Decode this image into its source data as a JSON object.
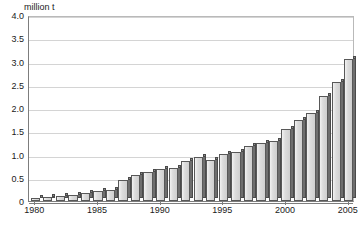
{
  "chart_data": {
    "type": "bar",
    "title": "",
    "subtitle": "",
    "unit_label": "million t",
    "xlabel": "",
    "ylabel": "million t",
    "ylim": [
      0,
      4.0
    ],
    "ytick_step": 0.5,
    "grid": true,
    "legend": null,
    "x_tick_labels": [
      "1980",
      "1985",
      "1990",
      "1995",
      "2000",
      "2005"
    ],
    "y_tick_labels": [
      "0",
      "0.5",
      "1.0",
      "1.5",
      "2.0",
      "2.5",
      "3.0",
      "3.5",
      "4.0"
    ],
    "y_tick_values": [
      0,
      0.5,
      1.0,
      1.5,
      2.0,
      2.5,
      3.0,
      3.5,
      4.0
    ],
    "categories": [
      "1980",
      "1981",
      "1982",
      "1983",
      "1984",
      "1985",
      "1986",
      "1987",
      "1988",
      "1989",
      "1990",
      "1991",
      "1992",
      "1993",
      "1994",
      "1995",
      "1996",
      "1997",
      "1998",
      "1999",
      "2000",
      "2001",
      "2002",
      "2003",
      "2004",
      "2005"
    ],
    "values": [
      0.06,
      0.08,
      0.1,
      0.14,
      0.17,
      0.22,
      0.24,
      0.45,
      0.55,
      0.62,
      0.68,
      0.72,
      0.85,
      0.95,
      0.88,
      1.02,
      1.05,
      1.18,
      1.25,
      1.3,
      1.55,
      1.75,
      1.9,
      2.25,
      2.55,
      3.05
    ],
    "colors": {
      "bar_face": "#dcdcdc",
      "bar_side": "#6e6e6e",
      "bar_outline": "#585858",
      "gridline": "#d4d4d4",
      "axis": "#7d7d7d",
      "text": "#1a1a1a",
      "background": "#ffffff"
    }
  }
}
